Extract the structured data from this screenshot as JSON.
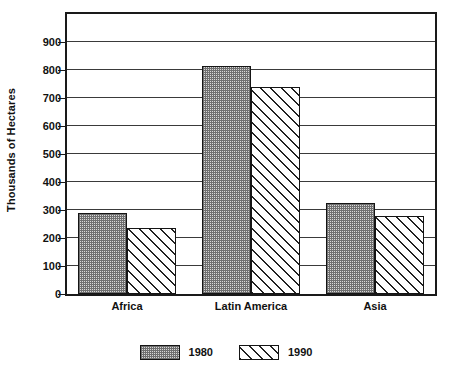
{
  "chart_data": {
    "type": "bar",
    "title": "",
    "subtitle": "",
    "xlabel": "",
    "ylabel": "Thousands of Hectares",
    "categories": [
      "Africa",
      "Latin America",
      "Asia"
    ],
    "series": [
      {
        "name": "1980",
        "values": [
          290,
          815,
          325
        ],
        "pattern": "stipple-gray"
      },
      {
        "name": "1990",
        "values": [
          235,
          740,
          280
        ],
        "pattern": "diagonal-hatch"
      }
    ],
    "ylim": [
      0,
      1000
    ],
    "yticks": [
      0,
      100,
      200,
      300,
      400,
      500,
      600,
      700,
      800,
      900
    ],
    "ytick_labels": [
      "0",
      "100",
      "200",
      "300",
      "400",
      "500",
      "600",
      "700",
      "800",
      "900"
    ],
    "grid": true,
    "grid_axis": "y",
    "legend": [
      "1980",
      "1990"
    ],
    "legend_position": "bottom-center",
    "frame": true,
    "colors": {
      "axis": "#1a1a1a",
      "grid": "#3a3a3a",
      "text": "#111111",
      "background": "#ffffff",
      "series_1980": "#9a9a9a",
      "series_1990": "#ffffff"
    }
  }
}
